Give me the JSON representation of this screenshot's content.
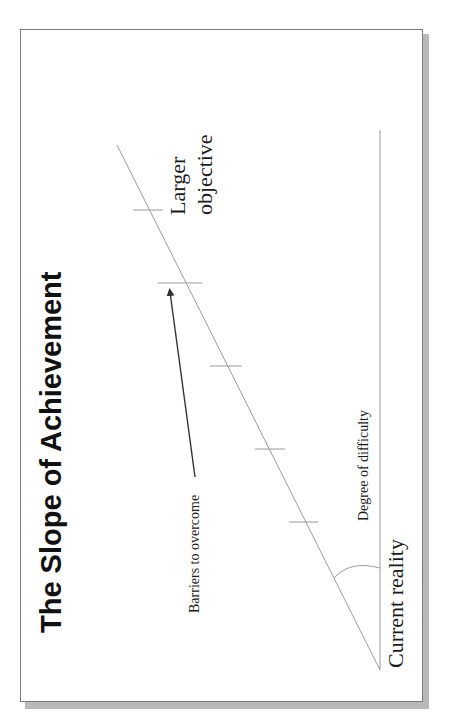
{
  "slide": {
    "title": "The Slope of Achievement",
    "labels": {
      "larger_line1": "Larger",
      "larger_line2": "objective",
      "barriers": "Barriers to overcome",
      "degree": "Degree of difficulty",
      "current": "Current reality"
    },
    "colors": {
      "line": "#9a9a9a",
      "arrow": "#333333",
      "text": "#1a1a1a",
      "border": "#7a7a7a",
      "shadow": "#b9b9b9"
    },
    "slope": {
      "start": [
        117,
        145
      ],
      "end": [
        380,
        670
      ]
    },
    "baseline": {
      "x": 380,
      "y_top": 130,
      "y_bottom": 670
    },
    "barrier_ticks": [
      {
        "y": 210,
        "x1": 133,
        "x2": 163
      },
      {
        "y": 283,
        "x1": 158,
        "x2": 202
      },
      {
        "y": 366,
        "x1": 210,
        "x2": 242
      },
      {
        "y": 449,
        "x1": 255,
        "x2": 285
      },
      {
        "y": 522,
        "x1": 289,
        "x2": 318
      }
    ]
  }
}
